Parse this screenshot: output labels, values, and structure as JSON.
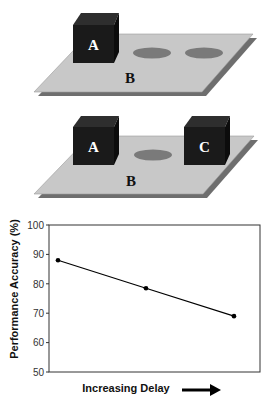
{
  "scenes": [
    {
      "id": "scene-1",
      "plate_label": "B",
      "cubes": [
        {
          "label": "A"
        }
      ],
      "ellipse_count": 2
    },
    {
      "id": "scene-2",
      "plate_label": "B",
      "cubes": [
        {
          "label": "A"
        },
        {
          "label": "C"
        }
      ],
      "ellipse_count": 1
    }
  ],
  "colors": {
    "plate": "#c8c8c8",
    "plate_shadow": "#6e6e6e",
    "cube_front": "#1a1a1a",
    "cube_top": "#2e2e2e",
    "cube_side": "#0c0c0c",
    "ellipse": "#7a7a7a",
    "line": "#000000"
  },
  "chart_data": {
    "type": "line",
    "title": "",
    "xlabel": "Increasing Delay",
    "ylabel": "Performance Accuracy (%)",
    "x": [
      1,
      2,
      3
    ],
    "categories": [
      "",
      "",
      ""
    ],
    "series": [
      {
        "name": "Performance Accuracy",
        "values": [
          88,
          78.5,
          69
        ]
      }
    ],
    "ylim": [
      50,
      100
    ],
    "yticks": [
      "100",
      "90",
      "80",
      "70",
      "60",
      "50"
    ],
    "grid": false,
    "legend": "none",
    "annotations": [
      "arrow pointing right next to x-axis label"
    ]
  }
}
